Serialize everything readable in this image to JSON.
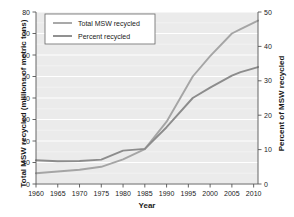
{
  "chart_data": {
    "type": "line",
    "title": "",
    "xlabel": "Year",
    "ylabel": "Total MSW recycled (millions of metric tons)",
    "ylabel_right": "Percent of MSW recycled",
    "xlim": [
      1960,
      2011
    ],
    "ylim": [
      0,
      80
    ],
    "ylim_right": [
      0,
      50
    ],
    "xticks": [
      1960,
      1965,
      1970,
      1975,
      1980,
      1985,
      1990,
      1995,
      2000,
      2005,
      2010
    ],
    "xtick_labels": [
      "1960",
      "1965",
      "1970",
      "1975",
      "1980",
      "1985",
      "1990",
      "1995",
      "2000",
      "2005",
      "2010"
    ],
    "yticks": [
      0,
      10,
      20,
      30,
      40,
      50,
      60,
      70,
      80
    ],
    "ytick_labels": [
      "0",
      "10",
      "20",
      "30",
      "40",
      "50",
      "60",
      "70",
      "80"
    ],
    "yticks_right": [
      0,
      10,
      20,
      30,
      40,
      50
    ],
    "ytick_labels_right": [
      "0",
      "10",
      "20",
      "30",
      "40",
      "50"
    ],
    "grid": true,
    "grid_color": "#ffffff",
    "plot_background": "#ebebeb",
    "legend_position": "top-left",
    "series": [
      {
        "name": "Total MSW recycled",
        "axis": "left",
        "color": "#a5a5a5",
        "x": [
          1960,
          1965,
          1970,
          1975,
          1980,
          1985,
          1990,
          1996,
          2000,
          2005,
          2007,
          2011
        ],
        "values": [
          5.0,
          5.8,
          6.6,
          8.0,
          11.5,
          16.2,
          29.0,
          50.0,
          59.5,
          70.0,
          72.0,
          76.0
        ]
      },
      {
        "name": "Percent recycled",
        "axis": "right",
        "color": "#8c8c8c",
        "x": [
          1960,
          1965,
          1970,
          1975,
          1980,
          1985,
          1990,
          1996,
          2000,
          2005,
          2007,
          2011
        ],
        "values": [
          6.9,
          6.6,
          6.7,
          7.1,
          9.7,
          10.2,
          16.5,
          25.0,
          28.0,
          31.5,
          32.5,
          34.0
        ]
      }
    ]
  },
  "legend": {
    "items": [
      {
        "label": "Total MSW recycled"
      },
      {
        "label": "Percent recycled"
      }
    ]
  }
}
